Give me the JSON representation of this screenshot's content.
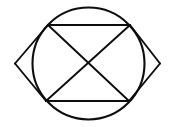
{
  "figure": {
    "canvas": {
      "width": 175,
      "height": 127,
      "background_color": "#ffffff"
    },
    "stroke_color": "#0d0d0d",
    "shapes": [
      {
        "name": "circle",
        "type": "circle",
        "center_x": 88.5,
        "center_y": 63.5,
        "radius": 56,
        "stroke_width": 2.1
      },
      {
        "name": "rhombus",
        "type": "polygon",
        "points": "48,25 160,63.5 129,101 15,63.5",
        "stroke_width": 1.9
      },
      {
        "name": "diagonal-top-left-to-bottom-right",
        "type": "line",
        "x1": 48,
        "y1": 25,
        "x2": 129,
        "y2": 101,
        "stroke_width": 1.9
      },
      {
        "name": "diagonal-left-to-right",
        "type": "line",
        "x1": 15,
        "y1": 63.5,
        "x2": 160,
        "y2": 63.5,
        "stroke_width": 0
      },
      {
        "name": "diagonal-bottom-left-to-top-right",
        "type": "line",
        "x1": 46,
        "y1": 101,
        "x2": 130,
        "y2": 25,
        "stroke_width": 1.9
      }
    ],
    "vertices": {
      "rhombus_top_left": "48,25",
      "rhombus_top_right": "130,25",
      "rhombus_left_tip": "15,63.5",
      "rhombus_right_tip": "160,63.5",
      "rhombus_bottom_left": "46,101",
      "rhombus_bottom_right": "129,101",
      "diagonal_intersection": "88,63.5"
    }
  }
}
